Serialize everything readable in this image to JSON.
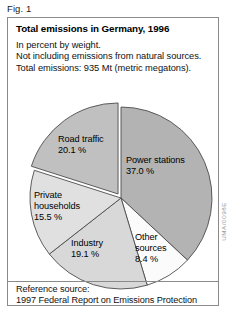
{
  "figure": {
    "caption": "Fig. 1",
    "watermark": "UMA/0098E"
  },
  "header": {
    "title": "Total emissions in Germany, 1996",
    "subtitle_lines": [
      "In percent by weight.",
      "Not including emissions from natural sources.",
      "Total emissions: 935 Mt (metric megatons)."
    ]
  },
  "footer": {
    "lines": [
      "Reference source:",
      "1997 Federal Report on Emissions Protection"
    ]
  },
  "chart_data": {
    "type": "pie",
    "title": "Total emissions in Germany, 1996",
    "subtitle": "In percent by weight. Not including emissions from natural sources. Total emissions: 935 Mt (metric megatons).",
    "unit": "percent",
    "total_label": "935 Mt (metric megatons)",
    "legend": "none (labels placed on slices)",
    "categories": [
      "Power stations",
      "Other sources",
      "Industry",
      "Private households",
      "Road traffic"
    ],
    "values": [
      37.0,
      8.4,
      19.1,
      15.5,
      20.1
    ],
    "slices": [
      {
        "name": "Power stations",
        "label_line1": "Power stations",
        "label_line2": "37.0 %",
        "value": 37.0,
        "color": "#b3b3b3",
        "exploded": false,
        "label_x": 118,
        "label_y": 145
      },
      {
        "name": "Other sources",
        "label_line1": "Other",
        "label_line2": "sources",
        "label_line3": "8.4 %",
        "value": 8.4,
        "color": "#fbfbfb",
        "exploded": false,
        "label_x": 127,
        "label_y": 222
      },
      {
        "name": "Industry",
        "label_line1": "Industry",
        "label_line2": "19.1 %",
        "value": 19.1,
        "color": "#d8d8d8",
        "exploded": false,
        "label_x": 63,
        "label_y": 228
      },
      {
        "name": "Private households",
        "label_line1": "Private",
        "label_line2": "households",
        "label_line3": "15.5 %",
        "value": 15.5,
        "color": "#e0e0e0",
        "exploded": false,
        "label_x": 26,
        "label_y": 180
      },
      {
        "name": "Road traffic",
        "label_line1": "Road traffic",
        "label_line2": "20.1 %",
        "value": 20.1,
        "color": "#c0c0c0",
        "exploded": true,
        "label_x": 50,
        "label_y": 124
      }
    ],
    "geometry": {
      "center_x": 113,
      "center_y": 180,
      "radius": 91,
      "start_angle_deg": -90,
      "direction": "clockwise",
      "explode_offset": 5
    },
    "colors": {
      "power_stations": "#b3b3b3",
      "other_sources": "#fbfbfb",
      "industry": "#d8d8d8",
      "private_households": "#e0e0e0",
      "road_traffic": "#c0c0c0",
      "stroke": "#4d4d4d",
      "border": "#8a8a8a"
    }
  }
}
